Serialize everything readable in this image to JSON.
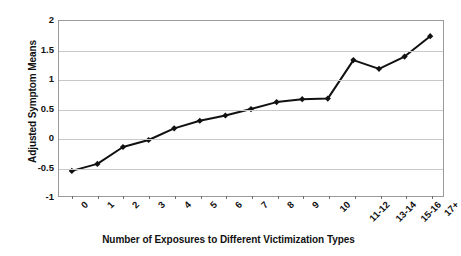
{
  "chart_data": {
    "type": "line",
    "title": "",
    "xlabel": "Number of Exposures to Different Victimization Types",
    "ylabel": "Adjusted Symptom Means",
    "categories": [
      "0",
      "1",
      "2",
      "3",
      "4",
      "5",
      "6",
      "7",
      "8",
      "9",
      "10",
      "11-12",
      "13-14",
      "15-16",
      "17+"
    ],
    "values": [
      -0.57,
      -0.45,
      -0.16,
      -0.04,
      0.16,
      0.29,
      0.38,
      0.49,
      0.61,
      0.66,
      0.67,
      1.33,
      1.18,
      1.39,
      1.74
    ],
    "series": [
      {
        "name": "Adjusted Symptom Means",
        "values": [
          -0.57,
          -0.45,
          -0.16,
          -0.04,
          0.16,
          0.29,
          0.38,
          0.49,
          0.61,
          0.66,
          0.67,
          1.33,
          1.18,
          1.39,
          1.74
        ]
      }
    ],
    "ylim": [
      -1,
      2
    ],
    "ytick_labels": [
      "2",
      "1.5",
      "1",
      "0.5",
      "0",
      "-0.5",
      "-1"
    ],
    "ytick_values": [
      2,
      1.5,
      1,
      0.5,
      0,
      -0.5,
      -1
    ],
    "grid": true,
    "legend": false,
    "legend_position": "none",
    "line_color": "#111111",
    "marker": "diamond",
    "marker_color": "#111111",
    "gridline_color": "#c8c8c8",
    "frame_color": "#9a9a9a",
    "background_color": "#ffffff"
  }
}
